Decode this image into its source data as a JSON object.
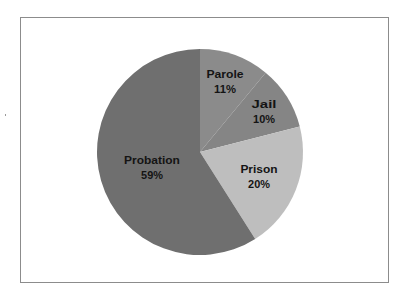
{
  "chart_data": {
    "type": "pie",
    "title": "",
    "start_angle_deg": 0,
    "direction": "clockwise",
    "slices": [
      {
        "label": "Parole",
        "value": 11,
        "display": "11%",
        "color": "#8b8b8b"
      },
      {
        "label": "Jail",
        "value": 10,
        "display": "10%",
        "color": "#858585"
      },
      {
        "label": "Prison",
        "value": 20,
        "display": "20%",
        "color": "#bebebe"
      },
      {
        "label": "Probation",
        "value": 59,
        "display": "59%",
        "color": "#6f6f6f"
      }
    ],
    "categories": [
      "Parole",
      "Jail",
      "Prison",
      "Probation"
    ],
    "values": [
      11,
      10,
      20,
      59
    ],
    "legend": "none",
    "labels_inside": true
  },
  "layout": {
    "center_x": 200,
    "center_y": 152,
    "radius": 103,
    "label_positions": [
      {
        "x": 225,
        "y1": 78,
        "y2": 93
      },
      {
        "x": 264,
        "y1": 108,
        "y2": 123
      },
      {
        "x": 259,
        "y1": 173,
        "y2": 188
      },
      {
        "x": 152,
        "y1": 164,
        "y2": 179
      }
    ]
  }
}
